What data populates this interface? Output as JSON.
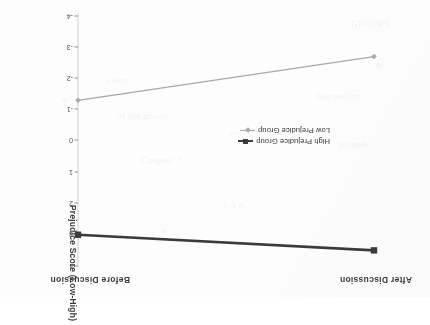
{
  "figure": {
    "axis_title": "Prejudice Score (Low-High)",
    "column_headers": [
      "Before Discussion",
      "After Discussion"
    ],
    "accent_dark": "#3b3b3b",
    "accent_light": "#a9a9a9",
    "rotation_note": "180"
  },
  "legend": {
    "entries": [
      {
        "label": "High Prejudice Group",
        "color": "#3b3b3b",
        "marker": "square"
      },
      {
        "label": "Low Prejudice Group",
        "color": "#a9a9a9",
        "marker": "diamond"
      }
    ]
  },
  "ticks": [
    {
      "label": "4",
      "y": 31
    },
    {
      "label": "3",
      "y": 63
    },
    {
      "label": "2",
      "y": 94
    },
    {
      "label": "1",
      "y": 125
    },
    {
      "label": "0",
      "y": 157
    },
    {
      "label": "-1",
      "y": 188
    },
    {
      "label": "-2",
      "y": 219
    },
    {
      "label": "-3",
      "y": 250
    },
    {
      "label": "-4",
      "y": 281
    }
  ],
  "ghost_text": [
    {
      "t": "Chapter 7",
      "x": 248,
      "y": 132
    },
    {
      "t": "attitude",
      "x": 60,
      "y": 148
    },
    {
      "t": "polarization",
      "x": 150,
      "y": 160
    },
    {
      "t": "of the group",
      "x": 262,
      "y": 176
    },
    {
      "t": "discussion",
      "x": 70,
      "y": 196
    },
    {
      "t": "GROUPS",
      "x": 40,
      "y": 268
    },
    {
      "t": "effect",
      "x": 300,
      "y": 212
    },
    {
      "t": "1 9 8",
      "x": 186,
      "y": 86
    }
  ],
  "chart_data": {
    "type": "line",
    "title": "",
    "xlabel": "",
    "ylabel": "Prejudice Score (Low-High)",
    "categories": [
      "Before Discussion",
      "After Discussion"
    ],
    "ylim": [
      -4,
      4
    ],
    "yticks": [
      -4,
      -3,
      -2,
      -1,
      0,
      1,
      2,
      3,
      4
    ],
    "grid": false,
    "legend_position": "center",
    "orientation": "page rotated 180 degrees",
    "series": [
      {
        "name": "High Prejudice Group",
        "color": "#3b3b3b",
        "marker": "square",
        "values": [
          3.0,
          3.5
        ]
      },
      {
        "name": "Low Prejudice Group",
        "color": "#a9a9a9",
        "marker": "diamond",
        "values": [
          -1.3,
          -2.7
        ]
      }
    ]
  }
}
